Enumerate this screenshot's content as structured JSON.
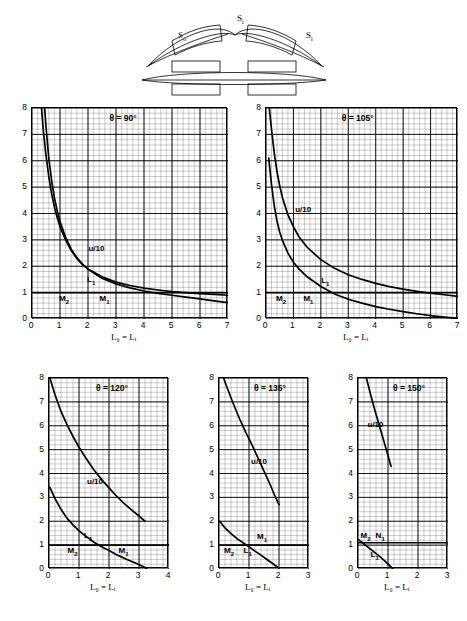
{
  "figure": {
    "diagram": {
      "name": "optical-element-diagram",
      "labels": [
        {
          "text": "S",
          "sub": "o",
          "x": 56,
          "y": 30
        },
        {
          "text": "S",
          "sub": "i",
          "x": 112,
          "y": 14
        },
        {
          "text": "S",
          "sub": "i",
          "x": 180,
          "y": 30
        }
      ]
    },
    "axis_title": "L₀ = Lᵢ",
    "curve_label_u": "u/10",
    "curve_label_L": "L",
    "curve_label_L_sub": "l",
    "curve_label_M2": "M",
    "curve_label_M2_sub": "2",
    "curve_label_M1": "M",
    "curve_label_M1_sub": "1"
  },
  "chart_data": [
    {
      "type": "line",
      "id": "theta-90",
      "title": "θ = 90°",
      "xlabel": "L₀ = Lᵢ",
      "ylabel": "",
      "xlim": [
        0,
        7
      ],
      "ylim": [
        0,
        8
      ],
      "xticks": [
        0,
        1,
        2,
        3,
        4,
        5,
        6,
        7
      ],
      "yticks": [
        0,
        1,
        2,
        3,
        4,
        5,
        6,
        7,
        8
      ],
      "grid": true,
      "series": [
        {
          "name": "u/10",
          "x": [
            0.34,
            0.4,
            0.5,
            0.6,
            0.7,
            0.8,
            0.9,
            1.0,
            1.2,
            1.4,
            1.6,
            1.8,
            2.0,
            2.5,
            3.0,
            3.5,
            4.0,
            4.5,
            5.0,
            5.5,
            6.0,
            6.5,
            7.0
          ],
          "y": [
            8.0,
            7.2,
            6.2,
            5.4,
            4.75,
            4.25,
            3.85,
            3.5,
            3.0,
            2.6,
            2.3,
            2.07,
            1.9,
            1.6,
            1.4,
            1.27,
            1.17,
            1.1,
            1.04,
            1.0,
            0.96,
            0.93,
            0.9
          ]
        },
        {
          "name": "L₁",
          "x": [
            0.45,
            0.5,
            0.6,
            0.7,
            0.8,
            0.9,
            1.0,
            1.2,
            1.4,
            1.6,
            1.8,
            2.0,
            2.5,
            3.0,
            3.5,
            4.0,
            4.5,
            5.0,
            5.5,
            6.0,
            6.5,
            7.0
          ],
          "y": [
            8.0,
            7.3,
            6.1,
            5.25,
            4.6,
            4.1,
            3.7,
            3.1,
            2.65,
            2.33,
            2.08,
            1.88,
            1.55,
            1.33,
            1.18,
            1.06,
            0.97,
            0.9,
            0.83,
            0.76,
            0.69,
            0.62
          ]
        },
        {
          "name": "M₂ / M₁",
          "horizontal": 1.0
        }
      ],
      "annotations": [
        {
          "text": "u/10",
          "x": 2.05,
          "y": 2.6
        },
        {
          "text": "L₁",
          "x": 2.0,
          "y": 1.45
        },
        {
          "text": "M₂",
          "x": 1.0,
          "y": 0.72
        },
        {
          "text": "M₁",
          "x": 2.45,
          "y": 0.72
        }
      ]
    },
    {
      "type": "line",
      "id": "theta-105",
      "title": "θ = 105°",
      "xlabel": "L₀ = Lᵢ",
      "ylabel": "",
      "xlim": [
        0,
        7
      ],
      "ylim": [
        0,
        8
      ],
      "xticks": [
        0,
        1,
        2,
        3,
        4,
        5,
        6,
        7
      ],
      "yticks": [
        0,
        1,
        2,
        3,
        4,
        5,
        6,
        7,
        8
      ],
      "grid": true,
      "series": [
        {
          "name": "u/10",
          "x": [
            0.12,
            0.2,
            0.3,
            0.4,
            0.5,
            0.6,
            0.8,
            1.0,
            1.2,
            1.5,
            2.0,
            2.5,
            3.0,
            3.5,
            4.0,
            4.5,
            5.0,
            5.5,
            6.0,
            6.5,
            7.0
          ],
          "y": [
            8.0,
            7.2,
            6.3,
            5.6,
            5.05,
            4.6,
            3.95,
            3.5,
            3.12,
            2.72,
            2.25,
            1.92,
            1.68,
            1.5,
            1.35,
            1.23,
            1.13,
            1.05,
            0.98,
            0.92,
            0.86
          ]
        },
        {
          "name": "L₁",
          "x": [
            0.1,
            0.15,
            0.2,
            0.3,
            0.4,
            0.5,
            0.6,
            0.8,
            1.0,
            1.2,
            1.5,
            2.0,
            2.5,
            3.0,
            3.5,
            4.0,
            4.5,
            5.0,
            5.5,
            6.0,
            6.5,
            7.0
          ],
          "y": [
            6.1,
            5.6,
            5.1,
            4.3,
            3.72,
            3.3,
            2.98,
            2.5,
            2.15,
            1.9,
            1.6,
            1.23,
            0.95,
            0.75,
            0.6,
            0.47,
            0.37,
            0.28,
            0.2,
            0.13,
            0.07,
            0.02
          ]
        },
        {
          "name": "M₂ / M₁",
          "horizontal": 1.0
        }
      ],
      "annotations": [
        {
          "text": "u/10",
          "x": 1.1,
          "y": 4.1
        },
        {
          "text": "L₁",
          "x": 2.05,
          "y": 1.4
        },
        {
          "text": "M₂",
          "x": 0.4,
          "y": 0.72
        },
        {
          "text": "M₁",
          "x": 1.4,
          "y": 0.72
        }
      ]
    },
    {
      "type": "line",
      "id": "theta-120",
      "title": "θ = 120°",
      "xlabel": "L₀ = Lᵢ",
      "ylabel": "",
      "xlim": [
        0,
        4
      ],
      "ylim": [
        0,
        8
      ],
      "xticks": [
        0,
        1,
        2,
        3,
        4
      ],
      "yticks": [
        0,
        1,
        2,
        3,
        4,
        5,
        6,
        7,
        8
      ],
      "grid": true,
      "series": [
        {
          "name": "u/10",
          "x": [
            0.03,
            0.2,
            0.4,
            0.6,
            0.8,
            1.0,
            1.2,
            1.5,
            1.8,
            2.0,
            2.2,
            2.5,
            2.8,
            3.0,
            3.2
          ],
          "y": [
            8.0,
            7.3,
            6.6,
            6.05,
            5.55,
            5.1,
            4.7,
            4.15,
            3.68,
            3.4,
            3.12,
            2.75,
            2.42,
            2.22,
            2.0
          ]
        },
        {
          "name": "L₁",
          "x": [
            0.03,
            0.2,
            0.4,
            0.6,
            0.8,
            1.0,
            1.2,
            1.5,
            1.8,
            2.0,
            2.3,
            2.6,
            2.9,
            3.1,
            3.25
          ],
          "y": [
            3.42,
            2.95,
            2.5,
            2.13,
            1.85,
            1.6,
            1.4,
            1.12,
            0.9,
            0.77,
            0.57,
            0.4,
            0.24,
            0.13,
            0.03
          ]
        },
        {
          "name": "M₂ / M₁",
          "horizontal": 1.0
        }
      ],
      "annotations": [
        {
          "text": "u/10",
          "x": 1.3,
          "y": 3.6
        },
        {
          "text": "L₁",
          "x": 1.2,
          "y": 1.35
        },
        {
          "text": "M₂",
          "x": 0.65,
          "y": 0.72
        },
        {
          "text": "M₁",
          "x": 2.35,
          "y": 0.72
        }
      ]
    },
    {
      "type": "line",
      "id": "theta-135",
      "title": "θ = 135°",
      "xlabel": "L₀ = Lᵢ",
      "ylabel": "",
      "xlim": [
        0,
        3
      ],
      "ylim": [
        0,
        8
      ],
      "xticks": [
        0,
        1,
        2,
        3
      ],
      "yticks": [
        0,
        1,
        2,
        3,
        4,
        5,
        6,
        7,
        8
      ],
      "grid": true,
      "series": [
        {
          "name": "u/10",
          "x": [
            0.15,
            0.3,
            0.5,
            0.7,
            0.9,
            1.1,
            1.3,
            1.5,
            1.7,
            1.85,
            2.0
          ],
          "y": [
            8.0,
            7.5,
            6.85,
            6.25,
            5.7,
            5.2,
            4.65,
            4.1,
            3.55,
            3.1,
            2.7
          ]
        },
        {
          "name": "L₁",
          "x": [
            0.02,
            0.2,
            0.4,
            0.6,
            0.8,
            1.0,
            1.2,
            1.4,
            1.6,
            1.8,
            2.0
          ],
          "y": [
            2.0,
            1.72,
            1.48,
            1.27,
            1.1,
            0.93,
            0.75,
            0.58,
            0.4,
            0.22,
            0.03
          ]
        },
        {
          "name": "M₂ / M₁",
          "horizontal": 1.0
        }
      ],
      "annotations": [
        {
          "text": "u/10",
          "x": 1.1,
          "y": 4.45
        },
        {
          "text": "M₁",
          "x": 1.3,
          "y": 1.3
        },
        {
          "text": "M₂",
          "x": 0.2,
          "y": 0.72
        },
        {
          "text": "L₁",
          "x": 0.85,
          "y": 0.72
        }
      ]
    },
    {
      "type": "line",
      "id": "theta-150",
      "title": "θ = 150°",
      "xlabel": "L₀ = Lᵢ",
      "ylabel": "",
      "xlim": [
        0,
        3
      ],
      "ylim": [
        0,
        8
      ],
      "xticks": [
        0,
        1,
        2,
        3
      ],
      "yticks": [
        0,
        1,
        2,
        3,
        4,
        5,
        6,
        7,
        8
      ],
      "grid": true,
      "series": [
        {
          "name": "u/10",
          "x": [
            0.28,
            0.4,
            0.55,
            0.7,
            0.85,
            1.0,
            1.1
          ],
          "y": [
            8.0,
            7.4,
            6.7,
            6.05,
            5.4,
            4.75,
            4.3
          ]
        },
        {
          "name": "L₁",
          "x": [
            0.02,
            0.15,
            0.3,
            0.5,
            0.7,
            0.9,
            1.05,
            1.15
          ],
          "y": [
            1.22,
            1.1,
            0.95,
            0.75,
            0.55,
            0.33,
            0.15,
            0.02
          ]
        },
        {
          "name": "M₂ / M₁",
          "horizontal": 1.1
        }
      ],
      "annotations": [
        {
          "text": "u/10",
          "x": 0.35,
          "y": 6.0
        },
        {
          "text": "M₂",
          "x": 0.12,
          "y": 1.32
        },
        {
          "text": "N₁",
          "x": 0.62,
          "y": 1.32
        },
        {
          "text": "L₁",
          "x": 0.45,
          "y": 0.55
        }
      ]
    }
  ]
}
